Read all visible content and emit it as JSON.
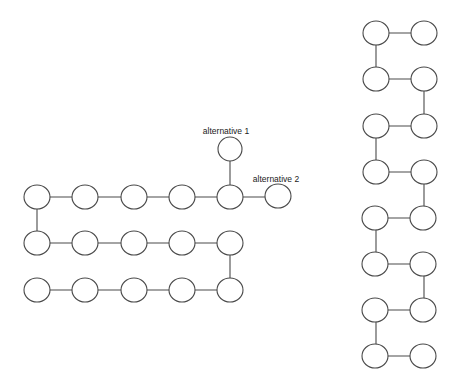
{
  "labels": {
    "alternative_1": "alternative 1",
    "alternative_2": "alternative 2"
  },
  "colors": {
    "stroke": "#4a4a4a",
    "node_fill": "#ffffff",
    "background": "#ffffff"
  },
  "left_diagram": {
    "description": "Serpentine chain of nodes (3 rows x 5) with two alternative branch nodes at the end of the top row",
    "rows": 3,
    "columns": 5,
    "branch_nodes": [
      "alternative 1 (up)",
      "alternative 2 (right)"
    ]
  },
  "right_diagram": {
    "description": "Serpentine chain of nodes in 2 columns x 8 rows",
    "rows": 8,
    "columns": 2
  }
}
